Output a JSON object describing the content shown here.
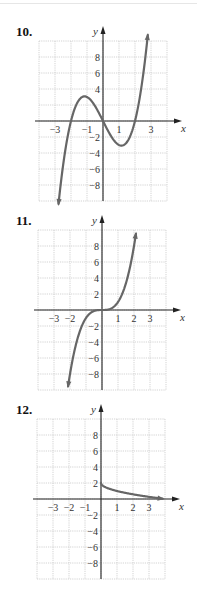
{
  "problems": [
    {
      "label": "10.",
      "top": 0,
      "grid": {
        "left": 39,
        "top": 41,
        "right": 167,
        "bottom": 201,
        "origin_x": 103,
        "origin_y": 121,
        "px_per_x": 16,
        "px_per_y": 8
      },
      "x_ticks": [
        {
          "v": -3,
          "t": "−3"
        },
        {
          "v": -1,
          "t": "−1"
        },
        {
          "v": 1,
          "t": "1"
        },
        {
          "v": 3,
          "t": "3"
        }
      ],
      "y_ticks": [
        {
          "v": 8,
          "t": "8"
        },
        {
          "v": 6,
          "t": "6"
        },
        {
          "v": 4,
          "t": "4"
        },
        {
          "v": -2,
          "t": "−2"
        },
        {
          "v": -4,
          "t": "−4"
        },
        {
          "v": -6,
          "t": "−6"
        },
        {
          "v": -8,
          "t": "−8"
        }
      ],
      "x_label": "x",
      "y_label": "y",
      "function": "x^3 - 4x",
      "domain": [
        -2.78,
        2.8
      ],
      "arrows": "both"
    },
    {
      "label": "11.",
      "top": 0,
      "grid": {
        "left": 38,
        "top": 230,
        "right": 166,
        "bottom": 390,
        "origin_x": 102,
        "origin_y": 310,
        "px_per_x": 16,
        "px_per_y": 8
      },
      "x_ticks": [
        {
          "v": -3,
          "t": "−3"
        },
        {
          "v": -2,
          "t": "−2"
        },
        {
          "v": 1,
          "t": "1"
        },
        {
          "v": 2,
          "t": "2"
        },
        {
          "v": 3,
          "t": "3"
        }
      ],
      "y_ticks": [
        {
          "v": 8,
          "t": "8"
        },
        {
          "v": 6,
          "t": "6"
        },
        {
          "v": 4,
          "t": "4"
        },
        {
          "v": 2,
          "t": "2"
        },
        {
          "v": -2,
          "t": "−2"
        },
        {
          "v": -4,
          "t": "−4"
        },
        {
          "v": -6,
          "t": "−6"
        },
        {
          "v": -8,
          "t": "−8"
        }
      ],
      "x_label": "x",
      "y_label": "y",
      "function": "x^3",
      "domain": [
        -2.12,
        2.12
      ],
      "arrows": "both"
    },
    {
      "label": "12.",
      "top": 0,
      "grid": {
        "left": 37,
        "top": 419,
        "right": 165,
        "bottom": 579,
        "origin_x": 101,
        "origin_y": 499,
        "px_per_x": 16,
        "px_per_y": 8
      },
      "x_ticks": [
        {
          "v": -3,
          "t": "−3"
        },
        {
          "v": -2,
          "t": "−2"
        },
        {
          "v": -1,
          "t": "−1"
        },
        {
          "v": 1,
          "t": "1"
        },
        {
          "v": 2,
          "t": "2"
        },
        {
          "v": 3,
          "t": "3"
        }
      ],
      "y_ticks": [
        {
          "v": 8,
          "t": "8"
        },
        {
          "v": 6,
          "t": "6"
        },
        {
          "v": 4,
          "t": "4"
        },
        {
          "v": 2,
          "t": "2"
        },
        {
          "v": -2,
          "t": "−2"
        },
        {
          "v": -4,
          "t": "−4"
        },
        {
          "v": -6,
          "t": "−6"
        },
        {
          "v": -8,
          "t": "−8"
        }
      ],
      "x_label": "x",
      "y_label": "y",
      "function": "2 - sqrt(x)",
      "domain": [
        0,
        3.85
      ],
      "arrows": "end"
    }
  ],
  "chart_data": [
    {
      "type": "line",
      "title": "10.",
      "xlabel": "x",
      "ylabel": "y",
      "xlim": [
        -4,
        4
      ],
      "ylim": [
        -10,
        10
      ],
      "grid": true,
      "x_tick_labels": [
        "-3",
        "-1",
        "1",
        "3"
      ],
      "y_tick_labels": [
        "8",
        "6",
        "4",
        "-2",
        "-4",
        "-6",
        "-8"
      ],
      "series": [
        {
          "name": "f(x)",
          "x": [
            -2.8,
            -2,
            -1.15,
            0,
            1.15,
            2,
            2.8
          ],
          "y": [
            -10.7,
            0,
            3.1,
            0,
            -3.1,
            0,
            10.7
          ]
        }
      ]
    },
    {
      "type": "line",
      "title": "11.",
      "xlabel": "x",
      "ylabel": "y",
      "xlim": [
        -4,
        4
      ],
      "ylim": [
        -10,
        10
      ],
      "grid": true,
      "x_tick_labels": [
        "-3",
        "-2",
        "1",
        "2",
        "3"
      ],
      "y_tick_labels": [
        "8",
        "6",
        "4",
        "2",
        "-2",
        "-4",
        "-6",
        "-8"
      ],
      "series": [
        {
          "name": "f(x)",
          "x": [
            -2.1,
            -2,
            -1,
            0,
            1,
            2,
            2.1
          ],
          "y": [
            -9.3,
            -8,
            -1,
            0,
            1,
            8,
            9.3
          ]
        }
      ]
    },
    {
      "type": "line",
      "title": "12.",
      "xlabel": "x",
      "ylabel": "y",
      "xlim": [
        -4,
        4
      ],
      "ylim": [
        -10,
        10
      ],
      "grid": true,
      "x_tick_labels": [
        "-3",
        "-2",
        "-1",
        "1",
        "2",
        "3"
      ],
      "y_tick_labels": [
        "8",
        "6",
        "4",
        "2",
        "-2",
        "-4",
        "-6",
        "-8"
      ],
      "series": [
        {
          "name": "f(x)",
          "x": [
            0,
            1,
            2,
            3,
            3.85
          ],
          "y": [
            2,
            1,
            0.59,
            0.27,
            0.04
          ]
        }
      ]
    }
  ]
}
